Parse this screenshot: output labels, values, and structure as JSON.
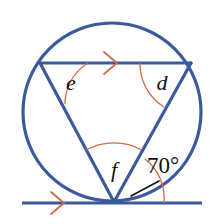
{
  "figure": {
    "background_color": "#ffffff",
    "colors": {
      "line_blue": "#3B5A9D",
      "arc_orange": "#D2694A",
      "arrow_orange": "#D2694A",
      "label_black": "#111111",
      "leader_black": "#111111"
    },
    "stroke_widths": {
      "circle": 3.2,
      "chord": 3.2,
      "tangent": 3.0,
      "arc": 1.3,
      "arrow": 1.6,
      "leader": 1.5
    }
  },
  "geometry": {
    "circle": {
      "cx": 112,
      "cy": 112,
      "r": 89
    },
    "points": {
      "left_vertex": {
        "x": 40,
        "y": 63,
        "name": "E"
      },
      "right_vertex": {
        "x": 191,
        "y": 63,
        "name": "D"
      },
      "apex": {
        "x": 114,
        "y": 202,
        "name": "F"
      }
    },
    "top_chord": {
      "x1": 40,
      "y1": 63,
      "x2": 191,
      "y2": 63
    },
    "left_side": {
      "x1": 40,
      "y1": 63,
      "x2": 114,
      "y2": 202
    },
    "right_side": {
      "x1": 191,
      "y1": 63,
      "x2": 114,
      "y2": 202
    },
    "tangent_line": {
      "x1": 22,
      "y1": 203,
      "x2": 202,
      "y2": 203
    }
  },
  "labels": {
    "angle_e": {
      "text": "e",
      "x": 71,
      "y": 85,
      "font_size": 22
    },
    "angle_d": {
      "text": "d",
      "x": 162,
      "y": 85,
      "font_size": 22
    },
    "angle_f": {
      "text": "f",
      "x": 114,
      "y": 172,
      "font_size": 22
    },
    "angle_70": {
      "text": "70°",
      "x": 163,
      "y": 168,
      "font_size": 23
    }
  },
  "arcs": {
    "arc_e": {
      "description": "angle arc at left vertex E",
      "color": "#D2694A"
    },
    "arc_d": {
      "description": "angle arc at right vertex D",
      "color": "#D2694A"
    },
    "arc_f": {
      "description": "angle arc at apex F between the two triangle sides",
      "color": "#D2694A"
    },
    "arc_70": {
      "description": "angle arc at apex between right side and tangent line",
      "color": "#D2694A"
    }
  },
  "markers": {
    "arrow_top_chord": {
      "description": "single chevron arrow marking parallel direction on top chord",
      "x": 112,
      "y": 63,
      "direction": "right"
    },
    "arrow_tangent": {
      "description": "single chevron arrow marking parallel direction on tangent line",
      "x": 59,
      "y": 203,
      "direction": "right"
    }
  },
  "leader": {
    "description": "black leader line from 70 degree label to its angle arc",
    "x1": 159,
    "y1": 181,
    "x2": 131,
    "y2": 196
  }
}
